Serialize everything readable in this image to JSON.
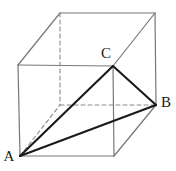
{
  "figure": {
    "canvas": {
      "width": 176,
      "height": 171
    },
    "background_color": "#ffffff",
    "colors": {
      "cube_edge": "#777777",
      "hidden_edge": "#8a8a8a",
      "triangle_edge": "#1a1a1a",
      "label_text": "#1a1a1a"
    },
    "stroke_widths": {
      "cube_edge": 1.2,
      "hidden_edge": 1.1,
      "triangle_edge": 2.1
    },
    "dash_pattern": "4,3"
  },
  "vertices": {
    "front_top_left": {
      "name": "front-top-left",
      "x": 18,
      "y": 65
    },
    "front_top_right": {
      "name": "front-top-right",
      "x": 113,
      "y": 66
    },
    "front_bottom_left": {
      "name": "front-bottom-left",
      "x": 20,
      "y": 156
    },
    "front_bottom_right": {
      "name": "front-bottom-right",
      "x": 114,
      "y": 156
    },
    "back_top_left": {
      "name": "back-top-left",
      "x": 60,
      "y": 13
    },
    "back_top_right": {
      "name": "back-top-right",
      "x": 155,
      "y": 13
    },
    "back_bottom_left": {
      "name": "back-bottom-left",
      "x": 60,
      "y": 105
    },
    "back_bottom_right": {
      "name": "back-bottom-right",
      "x": 156,
      "y": 105
    }
  },
  "labels": [
    {
      "id": "A",
      "text": "A",
      "x": 9,
      "y": 158
    },
    {
      "id": "B",
      "text": "B",
      "x": 166,
      "y": 104
    },
    {
      "id": "C",
      "text": "C",
      "x": 106,
      "y": 55
    }
  ],
  "label_points": {
    "A": "front-bottom-left",
    "B": "back-bottom-right",
    "C": "front-top-right"
  },
  "edges": {
    "solid_cube": [
      {
        "name": "front-top-edge",
        "x1": 18,
        "y1": 65,
        "x2": 113,
        "y2": 66
      },
      {
        "name": "front-left-edge",
        "x1": 18,
        "y1": 65,
        "x2": 20,
        "y2": 156
      },
      {
        "name": "front-bottom-edge",
        "x1": 20,
        "y1": 156,
        "x2": 114,
        "y2": 156
      },
      {
        "name": "front-right-edge",
        "x1": 113,
        "y1": 66,
        "x2": 114,
        "y2": 156
      },
      {
        "name": "back-top-edge",
        "x1": 60,
        "y1": 13,
        "x2": 155,
        "y2": 13
      },
      {
        "name": "back-right-edge",
        "x1": 155,
        "y1": 13,
        "x2": 156,
        "y2": 105
      },
      {
        "name": "top-left-connector",
        "x1": 18,
        "y1": 65,
        "x2": 60,
        "y2": 13
      },
      {
        "name": "top-right-connector",
        "x1": 113,
        "y1": 66,
        "x2": 155,
        "y2": 13
      },
      {
        "name": "bottom-right-connector",
        "x1": 114,
        "y1": 156,
        "x2": 156,
        "y2": 105
      }
    ],
    "dashed_cube": [
      {
        "name": "back-left-vertical-edge",
        "x1": 60,
        "y1": 13,
        "x2": 60,
        "y2": 105
      },
      {
        "name": "back-bottom-edge",
        "x1": 60,
        "y1": 105,
        "x2": 156,
        "y2": 105
      },
      {
        "name": "bottom-left-connector",
        "x1": 20,
        "y1": 156,
        "x2": 60,
        "y2": 105
      }
    ],
    "triangle": [
      {
        "name": "segment-AB",
        "from": "A",
        "to": "B",
        "x1": 20,
        "y1": 156,
        "x2": 156,
        "y2": 105
      },
      {
        "name": "segment-AC",
        "from": "A",
        "to": "C",
        "x1": 20,
        "y1": 156,
        "x2": 113,
        "y2": 66
      },
      {
        "name": "segment-CB",
        "from": "C",
        "to": "B",
        "x1": 113,
        "y1": 66,
        "x2": 156,
        "y2": 105
      }
    ]
  }
}
